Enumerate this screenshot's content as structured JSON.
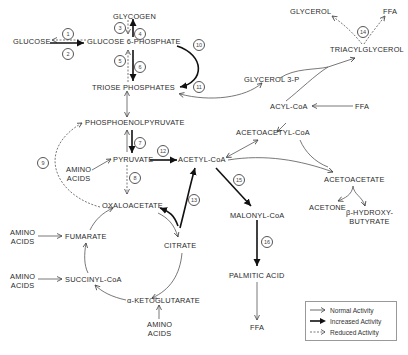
{
  "diagram": {
    "metabolites": {
      "glycogen": "GLYCOGEN",
      "glucose": "GLUCOSE",
      "glucose_6_phosphate": "GLUCOSE 6-PHOSPHATE",
      "triose_phosphates": "TRIOSE PHOSPHATES",
      "phosphoenolpyruvate": "PHOSPHOENOLPYRUVATE",
      "pyruvate": "PYRUVATE",
      "acetyl_coa": "ACETYL-CoA",
      "oxaloacetate": "OXALOACETATE",
      "citrate": "CITRATE",
      "fumarate": "FUMARATE",
      "succinyl_coa": "SUCCINYL-CoA",
      "alpha_ketoglutarate": "α-KETOGLUTARATE",
      "glycerol": "GLYCEROL",
      "ffa_top": "FFA",
      "triacylglycerol": "TRIACYLGLYCEROL",
      "glycerol_3_p": "GLYCEROL 3-P",
      "acyl_coa": "ACYL-CoA",
      "ffa_acyl": "FFA",
      "acetoacetyl_coa": "ACETOACETYL-CoA",
      "acetoacetate": "ACETOACETATE",
      "acetone": "ACETONE",
      "beta_hydroxy_1": "β-HYDROXY-",
      "beta_hydroxy_2": "BUTYRATE",
      "malonyl_coa": "MALONYL-CoA",
      "palmitic_acid": "PALMITIC ACID",
      "ffa_bottom": "FFA",
      "amino_acids_pyruvate_1": "AMINO",
      "amino_acids_pyruvate_2": "ACIDS",
      "amino_acids_fumarate_1": "AMINO",
      "amino_acids_fumarate_2": "ACIDS",
      "amino_acids_succinyl_1": "AMINO",
      "amino_acids_succinyl_2": "ACIDS",
      "amino_acids_akg_1": "AMINO",
      "amino_acids_akg_2": "ACIDS"
    },
    "steps": [
      "1",
      "2",
      "3",
      "4",
      "5",
      "6",
      "7",
      "8",
      "9",
      "10",
      "11",
      "12",
      "13",
      "14",
      "15",
      "16"
    ],
    "legend": {
      "normal": "Normal Activity",
      "increased": "Increased Activity",
      "reduced": "Reduced Activity"
    },
    "colors": {
      "line": "#444444",
      "bold_line": "#111111",
      "text": "#2a2a2a"
    }
  }
}
